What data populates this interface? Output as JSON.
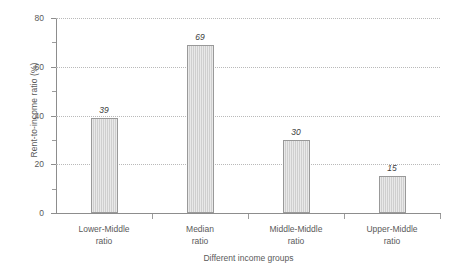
{
  "chart_data": {
    "type": "bar",
    "title": "",
    "subtitle": "",
    "xlabel": "Different income groups",
    "ylabel": "Rent-to-income ratio (%)",
    "categories": [
      "Lower-Middle\nratio",
      "Median\nratio",
      "Middle-Middle\nratio",
      "Upper-Middle\nratio"
    ],
    "category_lines": [
      [
        "Lower-Middle",
        "ratio"
      ],
      [
        "Median",
        "ratio"
      ],
      [
        "Middle-Middle",
        "ratio"
      ],
      [
        "Upper-Middle",
        "ratio"
      ]
    ],
    "values": [
      39,
      69,
      30,
      15
    ],
    "value_labels": [
      "39",
      "69",
      "30",
      "15"
    ],
    "ylim": [
      0,
      80
    ],
    "ytick_values": [
      0,
      20,
      40,
      60,
      80
    ],
    "ytick_labels": [
      "0",
      "20",
      "40",
      "60",
      "80"
    ],
    "yminor_ticks": [
      10,
      30,
      50,
      70
    ],
    "grid": "horizontal-dotted",
    "legend": "none",
    "bar_fill_color": "#cfcfcf",
    "bar_border_color": "#999999",
    "gridline_color": "#b9b9b9",
    "axis_color": "#8d8d8d",
    "text_color": "#5a5a5a"
  }
}
